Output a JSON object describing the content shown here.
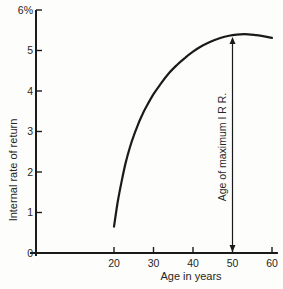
{
  "colors": {
    "background": "#fdfdfb",
    "curve": "#1a1a1a",
    "axis": "#1a1a1a",
    "arrow": "#1a1a1a",
    "text": "#262626"
  },
  "chart_data": {
    "type": "line",
    "title": "",
    "xlabel": "Age in years",
    "ylabel": "Internal rate of return",
    "xlim": [
      0,
      61.5
    ],
    "ylim": [
      0,
      6
    ],
    "grid": false,
    "x_tick_values": [
      20,
      30,
      40,
      50,
      60
    ],
    "x_tick_labels": [
      "20",
      "30",
      "40",
      "50",
      "60"
    ],
    "y_tick_values": [
      0,
      1,
      2,
      3,
      4,
      5,
      6
    ],
    "y_tick_labels": [
      "0",
      "1",
      "2",
      "3",
      "4",
      "5",
      "6%"
    ],
    "series": [
      {
        "name": "Internal rate of return vs age",
        "x": [
          20,
          21,
          22,
          23,
          24,
          25,
          26,
          27,
          28,
          30,
          32,
          34,
          36,
          38,
          40,
          42,
          44,
          46,
          48,
          50,
          52,
          54,
          56,
          58,
          60
        ],
        "y": [
          0.65,
          1.3,
          1.8,
          2.25,
          2.6,
          2.9,
          3.15,
          3.38,
          3.58,
          3.92,
          4.2,
          4.45,
          4.65,
          4.82,
          4.97,
          5.1,
          5.2,
          5.28,
          5.34,
          5.38,
          5.4,
          5.4,
          5.38,
          5.35,
          5.31
        ]
      }
    ],
    "annotation": {
      "label": "Age of maximum I R R.",
      "x": 50,
      "arrow_from_y": 0,
      "arrow_to_y": 5.38
    }
  }
}
